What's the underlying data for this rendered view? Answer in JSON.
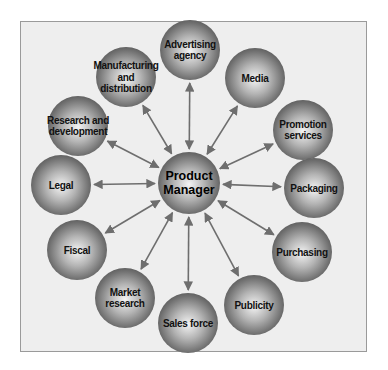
{
  "diagram": {
    "title": "",
    "center": {
      "id": "product-manager",
      "lines": [
        "Product",
        "Manager"
      ],
      "x": 189,
      "y": 183,
      "r": 31
    },
    "nodes": [
      {
        "id": "advertising-agency",
        "lines": [
          "Advertising",
          "agency"
        ],
        "x": 190,
        "y": 50
      },
      {
        "id": "media",
        "lines": [
          "Media"
        ],
        "x": 255,
        "y": 78
      },
      {
        "id": "promotion-services",
        "lines": [
          "Promotion",
          "services"
        ],
        "x": 303,
        "y": 130
      },
      {
        "id": "packaging",
        "lines": [
          "Packaging"
        ],
        "x": 314,
        "y": 188
      },
      {
        "id": "purchasing",
        "lines": [
          "Purchasing"
        ],
        "x": 302,
        "y": 252
      },
      {
        "id": "publicity",
        "lines": [
          "Publicity"
        ],
        "x": 254,
        "y": 305
      },
      {
        "id": "sales-force",
        "lines": [
          "Sales force"
        ],
        "x": 188,
        "y": 323
      },
      {
        "id": "market-research",
        "lines": [
          "Market",
          "research"
        ],
        "x": 125,
        "y": 298
      },
      {
        "id": "fiscal",
        "lines": [
          "Fiscal"
        ],
        "x": 77,
        "y": 250
      },
      {
        "id": "legal",
        "lines": [
          "Legal"
        ],
        "x": 61,
        "y": 185
      },
      {
        "id": "research-and-development",
        "lines": [
          "Research and",
          "development"
        ],
        "x": 78,
        "y": 126
      },
      {
        "id": "manufacturing-and-distribution",
        "lines": [
          "Manufacturing",
          "and",
          "distribution"
        ],
        "x": 126,
        "y": 77
      }
    ],
    "node_radius": 30,
    "connector": "bidirectional-arrow",
    "colors": {
      "frame_bg": "#eeeeee",
      "frame_border": "#9a9a9a",
      "sphere_light": "#f2f2f2",
      "sphere_mid": "#a8a8a8",
      "sphere_dark": "#555555",
      "arrow": "#6e6e6e",
      "text": "#111111"
    }
  }
}
